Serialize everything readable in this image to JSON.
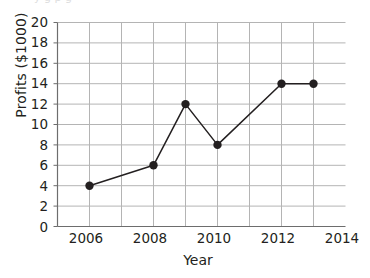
{
  "chart_data": {
    "type": "line",
    "title": "",
    "xlabel": "Year",
    "ylabel": "Profits ($1000)",
    "x": [
      2006,
      2008,
      2009,
      2010,
      2012,
      2013
    ],
    "values": [
      4,
      6,
      12,
      8,
      14,
      14
    ],
    "points": [
      {
        "x": 2006,
        "y": 4
      },
      {
        "x": 2008,
        "y": 6
      },
      {
        "x": 2009,
        "y": 12
      },
      {
        "x": 2010,
        "y": 8
      },
      {
        "x": 2012,
        "y": 14
      },
      {
        "x": 2013,
        "y": 14
      }
    ],
    "xlim": [
      2005,
      2014
    ],
    "ylim": [
      0,
      20
    ],
    "xticks": [
      2006,
      2008,
      2010,
      2012,
      2014
    ],
    "xtick_labels": [
      "2006",
      "2008",
      "2010",
      "2012",
      "2014"
    ],
    "x_gridline_step": 1,
    "yticks": [
      0,
      2,
      4,
      6,
      8,
      10,
      12,
      14,
      16,
      18,
      20
    ],
    "ytick_labels": [
      "0",
      "2",
      "4",
      "6",
      "8",
      "10",
      "12",
      "14",
      "16",
      "18",
      "20"
    ],
    "y_gridline_step": 2,
    "grid": true,
    "legend": false,
    "legend_position": "none",
    "marker": "circle-filled",
    "line_color": "#231f20",
    "marker_color": "#231f20",
    "grid_color": "#b4b4b4",
    "axis_color": "#6d6d6d",
    "background": "#ffffff"
  },
  "page": {
    "cutoff_text": "y g p g"
  }
}
